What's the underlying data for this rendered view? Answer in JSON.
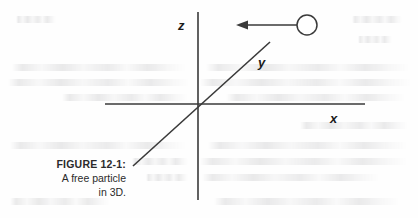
{
  "figure": {
    "caption_title": "FIGURE 12-1:",
    "caption_line_1": "A free particle",
    "caption_line_2": "in 3D.",
    "background_color": "#fefefe",
    "ink_color": "#3a3a3a",
    "label_color": "#1b1b1b",
    "caption_color": "#2b2b2b"
  },
  "diagram": {
    "type": "3d-axes-schematic",
    "origin": {
      "x": 198,
      "y": 104
    },
    "axes": [
      {
        "name": "z",
        "label": "z",
        "orientation": "vertical",
        "x1": 198,
        "y1": 12,
        "x2": 198,
        "y2": 200,
        "label_x": 178,
        "label_y": 19
      },
      {
        "name": "x",
        "label": "x",
        "orientation": "horizontal",
        "x1": 105,
        "y1": 104,
        "x2": 365,
        "y2": 104,
        "label_x": 330,
        "label_y": 112
      },
      {
        "name": "y",
        "label": "y",
        "orientation": "diagonal",
        "x1": 133,
        "y1": 166,
        "x2": 270,
        "y2": 42,
        "label_x": 258,
        "label_y": 56
      }
    ],
    "particle": {
      "name": "free-particle",
      "shape": "open-circle",
      "cx": 307,
      "cy": 25,
      "r": 10,
      "fill": "#ffffff",
      "stroke": "#3a3a3a"
    },
    "velocity_arrow": {
      "name": "velocity-vector",
      "direction": "left",
      "x_tail": 297,
      "y_tail": 25,
      "x_head": 237,
      "y_head": 25,
      "stroke": "#3a3a3a"
    }
  }
}
